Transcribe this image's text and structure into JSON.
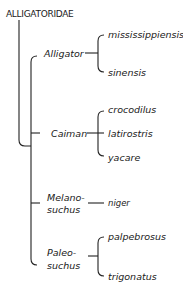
{
  "family": "ALLIGATORIDAE",
  "genera": [
    {
      "name": "Alligator",
      "species": [
        "mississippiensis",
        "sinensis"
      ]
    },
    {
      "name": "Caiman",
      "species": [
        "crocodilus",
        "latirostris",
        "yacare"
      ]
    },
    {
      "name_line1": "Melano-",
      "name_line2": "suchus",
      "species": [
        "niger"
      ]
    },
    {
      "name_line1": "Paleo-",
      "name_line2": "suchus",
      "species": [
        "palpebrosus",
        "trigonatus"
      ]
    }
  ],
  "colors": {
    "line": "#222222",
    "text": "#1a1a1a"
  }
}
